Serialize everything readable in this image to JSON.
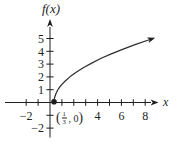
{
  "figure": {
    "background": "#ffffff",
    "ink": "#1e1e1e",
    "curve_color": "#2e2e2e"
  },
  "chart_data": {
    "type": "line",
    "title": "",
    "xlabel": "x",
    "ylabel": "f(x)",
    "xlim": [
      -3,
      9.5
    ],
    "ylim": [
      -2.9,
      6.4
    ],
    "grid": false,
    "x_ticks": [
      -2,
      -1,
      1,
      2,
      3,
      4,
      5,
      6,
      7,
      8
    ],
    "x_tick_labels": [
      {
        "v": -2,
        "t": "−2"
      },
      {
        "v": 4,
        "t": "4"
      },
      {
        "v": 6,
        "t": "6"
      },
      {
        "v": 8,
        "t": "8"
      }
    ],
    "y_ticks": [
      -2,
      -1,
      1,
      2,
      3,
      4,
      5
    ],
    "y_tick_labels": [
      {
        "v": -2,
        "t": "−2"
      },
      {
        "v": 1,
        "t": "1"
      },
      {
        "v": 2,
        "t": "2"
      },
      {
        "v": 3,
        "t": "3"
      },
      {
        "v": 4,
        "t": "4"
      },
      {
        "v": 5,
        "t": "5"
      }
    ],
    "series": [
      {
        "name": "f",
        "arrow_end": true,
        "points": [
          [
            0.333,
            0
          ],
          [
            0.36,
            0.283
          ],
          [
            0.4,
            0.447
          ],
          [
            0.5,
            0.707
          ],
          [
            0.65,
            0.975
          ],
          [
            0.8,
            1.183
          ],
          [
            1,
            1.414
          ],
          [
            1.3,
            1.703
          ],
          [
            1.7,
            2.025
          ],
          [
            2.2,
            2.366
          ],
          [
            2.8,
            2.72
          ],
          [
            3.5,
            3.082
          ],
          [
            4.3,
            3.45
          ],
          [
            5.2,
            3.821
          ],
          [
            6.2,
            4.195
          ],
          [
            7.2,
            4.539
          ],
          [
            8.4,
            4.919
          ]
        ]
      }
    ],
    "marked_point": {
      "x": 0.333,
      "y": 0,
      "style": "filled-dot"
    },
    "marked_point_label": {
      "open": "(",
      "numerator": "1",
      "denominator": "3",
      "rest": ", 0",
      "close": ")"
    }
  }
}
